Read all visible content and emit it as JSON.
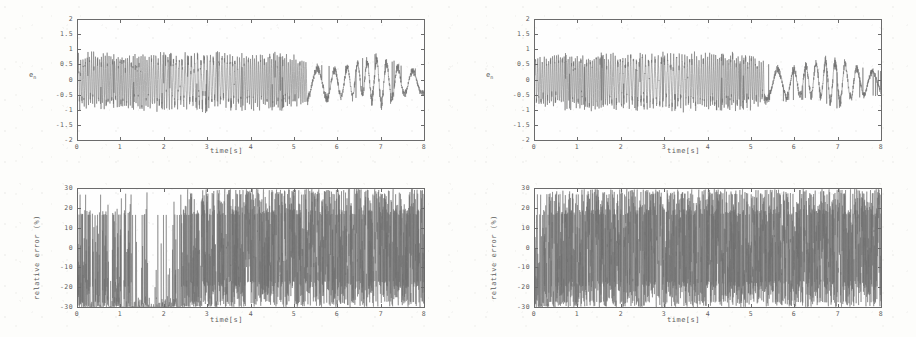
{
  "figure": {
    "layout": "2x2 grid of time-series plots",
    "background_color": "#fdfdfb",
    "trace_color": "#6f6f6f",
    "axis_color": "#6b6b6b"
  },
  "chart_data": [
    {
      "id": "top-left",
      "type": "line",
      "title": "",
      "xlabel": "time[s]",
      "ylabel": "e",
      "ylabel_sub": "n",
      "xlim": [
        0,
        8
      ],
      "ylim": [
        -2,
        2
      ],
      "xticks": [
        "0",
        "1",
        "2",
        "3",
        "4",
        "5",
        "6",
        "7",
        "8"
      ],
      "yticks": [
        "2",
        "1.5",
        "1",
        "0.5",
        "0",
        "-0.5",
        "-1",
        "-1.5",
        "-2"
      ],
      "grid": false,
      "legend": "none",
      "description": "High-frequency oscillating error signal, amplitude roughly +-1 for t<5.3s, decaying to slower +-0.8 oscillation afterwards",
      "envelope": [
        {
          "t": 0.0,
          "hi": 0.85,
          "lo": -0.95
        },
        {
          "t": 0.5,
          "hi": 0.9,
          "lo": -0.95
        },
        {
          "t": 1.0,
          "hi": 0.85,
          "lo": -1.0
        },
        {
          "t": 1.5,
          "hi": 0.85,
          "lo": -0.95
        },
        {
          "t": 2.0,
          "hi": 0.9,
          "lo": -1.0
        },
        {
          "t": 2.5,
          "hi": 0.85,
          "lo": -0.95
        },
        {
          "t": 3.0,
          "hi": 0.9,
          "lo": -1.0
        },
        {
          "t": 3.5,
          "hi": 0.9,
          "lo": -0.95
        },
        {
          "t": 4.0,
          "hi": 0.85,
          "lo": -1.0
        },
        {
          "t": 4.5,
          "hi": 0.9,
          "lo": -0.95
        },
        {
          "t": 5.0,
          "hi": 0.85,
          "lo": -0.9
        },
        {
          "t": 5.5,
          "hi": 0.5,
          "lo": -0.75
        },
        {
          "t": 6.0,
          "hi": 0.45,
          "lo": -0.7
        },
        {
          "t": 6.5,
          "hi": 0.7,
          "lo": -0.6
        },
        {
          "t": 7.0,
          "hi": 0.85,
          "lo": -0.95
        },
        {
          "t": 7.5,
          "hi": 0.45,
          "lo": -0.6
        },
        {
          "t": 8.0,
          "hi": 0.3,
          "lo": -0.5
        }
      ]
    },
    {
      "id": "top-right",
      "type": "line",
      "title": "",
      "xlabel": "time[s]",
      "ylabel": "e",
      "ylabel_sub": "n",
      "xlim": [
        0,
        8
      ],
      "ylim": [
        -2,
        2
      ],
      "xticks": [
        "0",
        "1",
        "2",
        "3",
        "4",
        "5",
        "6",
        "7",
        "8"
      ],
      "yticks": [
        "2",
        "1.5",
        "1",
        "0.5",
        "0",
        "-0.5",
        "-1",
        "-1.5",
        "-2"
      ],
      "grid": false,
      "legend": "none",
      "description": "High-frequency oscillating error signal nearly identical to top-left panel",
      "envelope": [
        {
          "t": 0.0,
          "hi": 0.8,
          "lo": -0.9
        },
        {
          "t": 0.5,
          "hi": 0.9,
          "lo": -0.95
        },
        {
          "t": 1.0,
          "hi": 0.85,
          "lo": -1.0
        },
        {
          "t": 1.5,
          "hi": 0.85,
          "lo": -1.0
        },
        {
          "t": 2.0,
          "hi": 0.9,
          "lo": -0.95
        },
        {
          "t": 2.5,
          "hi": 0.85,
          "lo": -1.0
        },
        {
          "t": 3.0,
          "hi": 0.9,
          "lo": -0.95
        },
        {
          "t": 3.5,
          "hi": 0.9,
          "lo": -1.0
        },
        {
          "t": 4.0,
          "hi": 0.85,
          "lo": -0.95
        },
        {
          "t": 4.5,
          "hi": 0.9,
          "lo": -1.0
        },
        {
          "t": 5.0,
          "hi": 0.85,
          "lo": -0.9
        },
        {
          "t": 5.5,
          "hi": 0.45,
          "lo": -0.75
        },
        {
          "t": 6.0,
          "hi": 0.45,
          "lo": -0.65
        },
        {
          "t": 6.5,
          "hi": 0.7,
          "lo": -0.6
        },
        {
          "t": 7.0,
          "hi": 0.8,
          "lo": -0.95
        },
        {
          "t": 7.5,
          "hi": 0.45,
          "lo": -0.6
        },
        {
          "t": 8.0,
          "hi": 0.3,
          "lo": -0.5
        }
      ]
    },
    {
      "id": "bottom-left",
      "type": "line",
      "title": "",
      "xlabel": "time[s]",
      "ylabel": "relative error (%)",
      "xlim": [
        0,
        8
      ],
      "ylim": [
        -30,
        30
      ],
      "xticks": [
        "0",
        "1",
        "2",
        "3",
        "4",
        "5",
        "6",
        "7",
        "8"
      ],
      "yticks": [
        "30",
        "20",
        "10",
        "0",
        "-10",
        "-20",
        "-30"
      ],
      "grid": false,
      "legend": "none",
      "description": "Relative error percentage, heavily clipped at +-30%. Sparse saturated spikes for t<2.5s, dense saturated noise for t>2.5s",
      "density": [
        {
          "t": 0.0,
          "fill": 0.55
        },
        {
          "t": 0.5,
          "fill": 0.35
        },
        {
          "t": 1.0,
          "fill": 0.3
        },
        {
          "t": 1.5,
          "fill": 0.12
        },
        {
          "t": 2.0,
          "fill": 0.1
        },
        {
          "t": 2.5,
          "fill": 0.55
        },
        {
          "t": 3.0,
          "fill": 0.8
        },
        {
          "t": 3.5,
          "fill": 0.85
        },
        {
          "t": 4.0,
          "fill": 0.9
        },
        {
          "t": 4.5,
          "fill": 0.9
        },
        {
          "t": 5.0,
          "fill": 0.92
        },
        {
          "t": 5.5,
          "fill": 0.92
        },
        {
          "t": 6.0,
          "fill": 0.9
        },
        {
          "t": 6.5,
          "fill": 0.92
        },
        {
          "t": 7.0,
          "fill": 0.9
        },
        {
          "t": 7.5,
          "fill": 0.92
        },
        {
          "t": 8.0,
          "fill": 0.9
        }
      ]
    },
    {
      "id": "bottom-right",
      "type": "line",
      "title": "",
      "xlabel": "time[s]",
      "ylabel": "relative error (%)",
      "xlim": [
        0,
        8
      ],
      "ylim": [
        -30,
        30
      ],
      "xticks": [
        "0",
        "1",
        "2",
        "3",
        "4",
        "5",
        "6",
        "7",
        "8"
      ],
      "yticks": [
        "30",
        "20",
        "10",
        "0",
        "-10",
        "-20",
        "-30"
      ],
      "grid": false,
      "legend": "none",
      "description": "Relative error percentage clipped at +-30%, dense saturated noise across the whole 0-8 s window",
      "density": [
        {
          "t": 0.0,
          "fill": 0.45
        },
        {
          "t": 0.5,
          "fill": 0.7
        },
        {
          "t": 1.0,
          "fill": 0.85
        },
        {
          "t": 1.5,
          "fill": 0.88
        },
        {
          "t": 2.0,
          "fill": 0.88
        },
        {
          "t": 2.5,
          "fill": 0.9
        },
        {
          "t": 3.0,
          "fill": 0.9
        },
        {
          "t": 3.5,
          "fill": 0.92
        },
        {
          "t": 4.0,
          "fill": 0.92
        },
        {
          "t": 4.5,
          "fill": 0.9
        },
        {
          "t": 5.0,
          "fill": 0.92
        },
        {
          "t": 5.5,
          "fill": 0.9
        },
        {
          "t": 6.0,
          "fill": 0.92
        },
        {
          "t": 6.5,
          "fill": 0.9
        },
        {
          "t": 7.0,
          "fill": 0.92
        },
        {
          "t": 7.5,
          "fill": 0.92
        },
        {
          "t": 8.0,
          "fill": 0.9
        }
      ]
    }
  ]
}
